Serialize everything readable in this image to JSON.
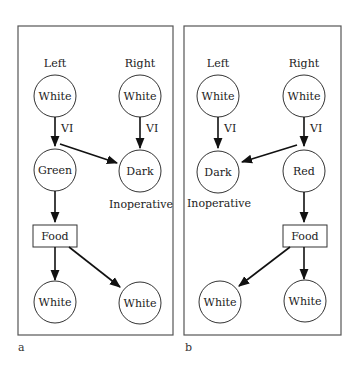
{
  "panels": [
    {
      "label": "a",
      "headers": {
        "left": "Left",
        "right": "Right"
      },
      "top_left": "White",
      "top_right": "White",
      "edge_label_left": "VI",
      "edge_label_right": "VI",
      "mid_left": "Green",
      "mid_right": "Dark",
      "inoperative": "Inoperative",
      "food": "Food",
      "bottom_left": "White",
      "bottom_right": "White"
    },
    {
      "label": "b",
      "headers": {
        "left": "Left",
        "right": "Right"
      },
      "top_left": "White",
      "top_right": "White",
      "edge_label_left": "VI",
      "edge_label_right": "VI",
      "mid_left": "Dark",
      "mid_right": "Red",
      "inoperative": "Inoperative",
      "food": "Food",
      "bottom_left": "White",
      "bottom_right": "White"
    }
  ],
  "colors": {
    "stroke": "#333333",
    "frame": "#555555",
    "background": "#ffffff"
  }
}
